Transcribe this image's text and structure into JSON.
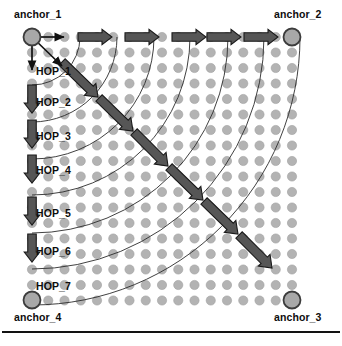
{
  "figure": {
    "type": "diagram"
  },
  "colors": {
    "node_fill": "#b3b3b3",
    "node_stroke": "#a0a0a0",
    "anchor_fill": "#a8a8a8",
    "anchor_stroke": "#3c3c3c",
    "arrow_fill": "#565656",
    "arrow_stroke": "#1a1a1a",
    "arc_stroke": "#2b2b2b",
    "thin_arrow": "#111111",
    "text": "#0d0d0d",
    "rule": "#121212",
    "background": "#ffffff"
  },
  "anchors": [
    {
      "id": "anchor_1",
      "label": "anchor_1",
      "cx": 32,
      "cy": 37,
      "r": 8.5,
      "label_x": 14,
      "label_y": 9
    },
    {
      "id": "anchor_2",
      "label": "anchor_2",
      "cx": 292,
      "cy": 37,
      "r": 8.5,
      "label_x": 274,
      "label_y": 9
    },
    {
      "id": "anchor_3",
      "label": "anchor_3",
      "cx": 292,
      "cy": 300,
      "r": 8.5,
      "label_x": 274,
      "label_y": 312
    },
    {
      "id": "anchor_4",
      "label": "anchor_4",
      "cx": 32,
      "cy": 300,
      "r": 8.5,
      "label_x": 14,
      "label_y": 312
    }
  ],
  "hop_labels": [
    {
      "label": "HOP_1",
      "x": 36,
      "y": 66
    },
    {
      "label": "HOP_2",
      "x": 36,
      "y": 97
    },
    {
      "label": "HOP_3",
      "x": 36,
      "y": 131
    },
    {
      "label": "HOP_4",
      "x": 36,
      "y": 165
    },
    {
      "label": "HOP_5",
      "x": 36,
      "y": 208
    },
    {
      "label": "HOP_6",
      "x": 36,
      "y": 246
    },
    {
      "label": "HOP_7",
      "x": 36,
      "y": 281
    }
  ],
  "grid": {
    "cols": 17,
    "rows": 18,
    "x0": 32,
    "y0": 37,
    "step_x": 16.25,
    "step_y": 15.5,
    "dot_r": 4.6
  },
  "hop_arcs": [
    {
      "hop": 1,
      "radius": 48
    },
    {
      "hop": 2,
      "radius": 85
    },
    {
      "hop": 3,
      "radius": 122
    },
    {
      "hop": 4,
      "radius": 158
    },
    {
      "hop": 5,
      "radius": 196
    },
    {
      "hop": 6,
      "radius": 232
    },
    {
      "hop": 7,
      "radius": 268
    }
  ],
  "horizontal_arrows": [
    {
      "x": 78,
      "y": 37
    },
    {
      "x": 125,
      "y": 37
    },
    {
      "x": 172,
      "y": 37
    },
    {
      "x": 207,
      "y": 37
    },
    {
      "x": 244,
      "y": 37
    }
  ],
  "vertical_arrows": [
    {
      "x": 32,
      "y": 85
    },
    {
      "x": 32,
      "y": 120
    },
    {
      "x": 32,
      "y": 155
    },
    {
      "x": 32,
      "y": 197
    },
    {
      "x": 32,
      "y": 234
    }
  ],
  "diagonal_arrows": [
    {
      "x1": 62,
      "y1": 62,
      "x2": 98,
      "y2": 97
    },
    {
      "x1": 99,
      "y1": 98,
      "x2": 133,
      "y2": 131
    },
    {
      "x1": 134,
      "y1": 132,
      "x2": 168,
      "y2": 166
    },
    {
      "x1": 169,
      "y1": 167,
      "x2": 203,
      "y2": 200
    },
    {
      "x1": 204,
      "y1": 201,
      "x2": 238,
      "y2": 234
    },
    {
      "x1": 239,
      "y1": 235,
      "x2": 272,
      "y2": 268
    }
  ],
  "seed_arrows": [
    {
      "kind": "right",
      "x1": 32,
      "y1": 37,
      "x2": 64,
      "y2": 37
    },
    {
      "kind": "down",
      "x1": 32,
      "y1": 37,
      "x2": 32,
      "y2": 70
    },
    {
      "kind": "diagonal",
      "x1": 32,
      "y1": 37,
      "x2": 62,
      "y2": 66
    }
  ],
  "base_rule": {
    "x": 2,
    "y": 331,
    "width": 338
  }
}
